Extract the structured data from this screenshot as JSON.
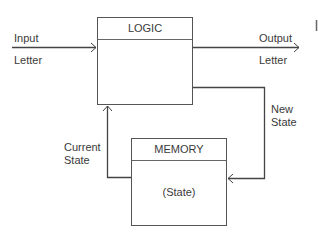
{
  "diagram": {
    "type": "block-diagram",
    "blocks": {
      "logic": {
        "title": "LOGIC",
        "content": ""
      },
      "memory": {
        "title": "MEMORY",
        "content": "(State)"
      }
    },
    "labels": {
      "input": "Input",
      "input_sub": "Letter",
      "output": "Output",
      "output_sub": "Letter",
      "new_state_1": "New",
      "new_state_2": "State",
      "current_state_1": "Current",
      "current_state_2": "State"
    },
    "edges": [
      {
        "from": "external",
        "to": "logic",
        "label": "Input Letter"
      },
      {
        "from": "logic",
        "to": "external",
        "label": "Output Letter"
      },
      {
        "from": "logic",
        "to": "memory",
        "label": "New State"
      },
      {
        "from": "memory",
        "to": "logic",
        "label": "Current State"
      }
    ]
  }
}
